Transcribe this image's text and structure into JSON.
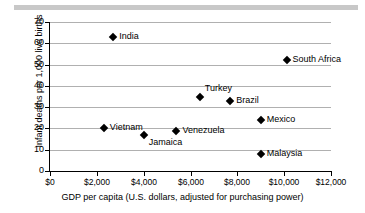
{
  "figure": {
    "decorative_rule": "grey-bar"
  },
  "chart_data": {
    "type": "scatter",
    "title": "",
    "xlabel": "GDP per capita (U.S. dollars, adjusted for purchasing power)",
    "ylabel": "Infant deaths per 1,000 live births",
    "xlim": [
      0,
      12000
    ],
    "ylim": [
      0,
      70
    ],
    "grid": "horizontal",
    "legend": "none",
    "xticks": [
      0,
      2000,
      4000,
      6000,
      8000,
      10000,
      12000
    ],
    "xticklabels": [
      "$0",
      "$2,000",
      "$4,000",
      "$6,000",
      "$8,000",
      "$10,000",
      "$12,000"
    ],
    "yticks": [
      0,
      10,
      20,
      30,
      40,
      50,
      60,
      70
    ],
    "yticklabels": [
      "0",
      "10",
      "20",
      "30",
      "40",
      "50",
      "60",
      "70"
    ],
    "marker": "diamond",
    "marker_color": "#000000",
    "points": [
      {
        "label": "India",
        "x": 2700,
        "y": 63,
        "label_pos": "right"
      },
      {
        "label": "South Africa",
        "x": 10100,
        "y": 52,
        "label_pos": "right"
      },
      {
        "label": "Turkey",
        "x": 6400,
        "y": 35,
        "label_pos": "above-right"
      },
      {
        "label": "Brazil",
        "x": 7700,
        "y": 33,
        "label_pos": "right"
      },
      {
        "label": "Mexico",
        "x": 9000,
        "y": 24,
        "label_pos": "right"
      },
      {
        "label": "Vietnam",
        "x": 2300,
        "y": 20,
        "label_pos": "right"
      },
      {
        "label": "Venezuela",
        "x": 5400,
        "y": 19,
        "label_pos": "right"
      },
      {
        "label": "Jamaica",
        "x": 4000,
        "y": 17,
        "label_pos": "below-right"
      },
      {
        "label": "Malaysia",
        "x": 9000,
        "y": 8,
        "label_pos": "right"
      }
    ]
  }
}
